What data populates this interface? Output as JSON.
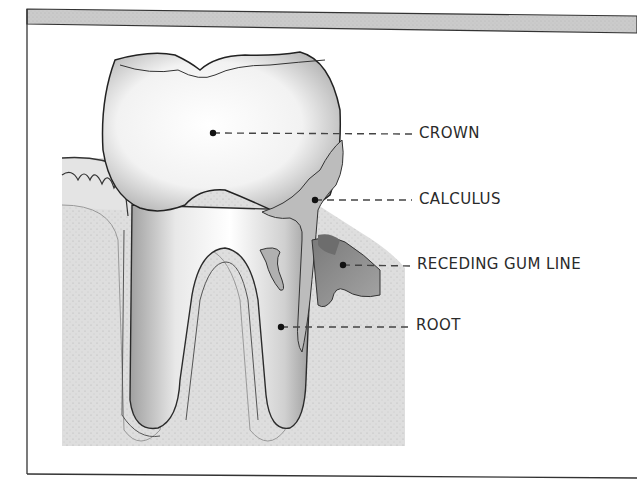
{
  "diagram": {
    "header_bar_color": "#c8c8c8",
    "labels": [
      {
        "id": "crown",
        "text": "CROWN",
        "dot": [
          213,
          133
        ],
        "text_pos": [
          419,
          126
        ]
      },
      {
        "id": "calculus",
        "text": "CALCULUS",
        "dot": [
          315,
          200
        ],
        "text_pos": [
          419,
          192
        ]
      },
      {
        "id": "receding-gum-line",
        "text": "RECEDING GUM LINE",
        "dot": [
          343,
          265
        ],
        "text_pos": [
          417,
          257
        ]
      },
      {
        "id": "root",
        "text": "ROOT",
        "dot": [
          281,
          327
        ],
        "text_pos": [
          416,
          318
        ]
      }
    ],
    "colors": {
      "tooth": "#f4f4f4",
      "outline": "#2b2b2b",
      "bone": "#dcdcdc",
      "gum": "#e6e6e6",
      "calculus": "#b9b9b9",
      "receding_gum": "#8f8f8f",
      "leader_line": "#444444"
    }
  }
}
